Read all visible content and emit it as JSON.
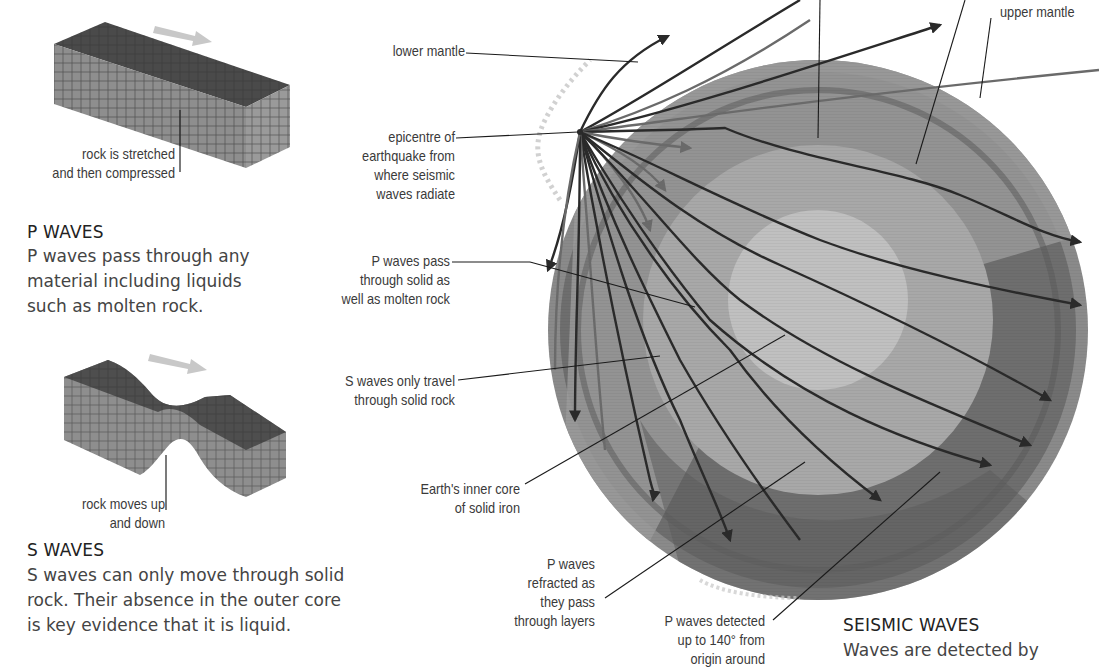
{
  "p_waves_panel": {
    "illustration_caption": [
      "rock is stretched",
      "and then compressed"
    ],
    "heading": "P WAVES",
    "body": [
      "P waves pass through any",
      "material including liquids",
      "such as molten rock."
    ]
  },
  "s_waves_panel": {
    "illustration_caption": [
      "rock moves up",
      "and down"
    ],
    "heading": "S WAVES",
    "body": [
      "S waves can only move through solid",
      "rock. Their absence in the outer core",
      "is key evidence that it is liquid."
    ]
  },
  "earth_diagram": {
    "labels": {
      "lower_mantle": [
        "lower mantle"
      ],
      "upper_mantle": [
        "upper mantle"
      ],
      "epicentre": [
        "epicentre of",
        "earthquake from",
        "where seismic",
        "waves radiate"
      ],
      "p_waves_pass": [
        "P waves pass",
        "through solid as",
        "well as molten rock"
      ],
      "s_waves_travel": [
        "S waves only travel",
        "through solid rock"
      ],
      "inner_core": [
        "Earth's inner core",
        "of solid iron"
      ],
      "p_waves_refracted": [
        "P waves",
        "refracted as",
        "they pass",
        "through layers"
      ],
      "p_waves_detected": [
        "P waves detected",
        "up to 140° from",
        "origin around"
      ]
    },
    "colors": {
      "crust": "#8a8a8a",
      "upper_mantle": "#6e6e6e",
      "lower_mantle": "#9a9a9a",
      "outer_core": "#a8a8a8",
      "inner_core": "#c0c0c0",
      "shadow_zone": "#5e5e5e",
      "wave_path": "#2a2a2a"
    }
  },
  "seismic_waves_panel": {
    "heading": "SEISMIC WAVES",
    "body": [
      "Waves are detected by"
    ]
  }
}
